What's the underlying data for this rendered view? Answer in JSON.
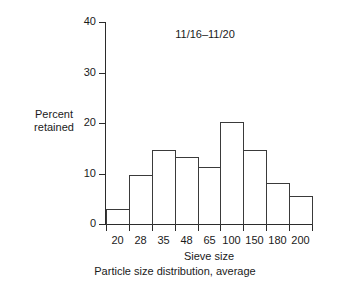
{
  "chart_data": {
    "type": "bar",
    "title": "",
    "annotation": "11/16–11/20",
    "xlabel": "Sieve size",
    "ylabel": "Percent\nretained",
    "caption": "Particle size distribution, average",
    "categories": [
      "20",
      "28",
      "35",
      "48",
      "65",
      "100",
      "150",
      "180",
      "200"
    ],
    "values": [
      3,
      9.7,
      14.7,
      13.3,
      11.2,
      20.2,
      14.7,
      8.1,
      5.5
    ],
    "ylim": [
      0,
      40
    ],
    "yticks": [
      0,
      10,
      20,
      30,
      40
    ],
    "ytick_labels": [
      "0",
      "10",
      "20",
      "30",
      "40"
    ],
    "grid": false,
    "legend": "none",
    "bar_style": "outlined-histogram",
    "colors": {
      "axis": "#2b2b2b",
      "bar_outline": "#3a3a3a",
      "bar_fill": "transparent",
      "text": "#1a1a1a",
      "background": "#ffffff"
    }
  }
}
